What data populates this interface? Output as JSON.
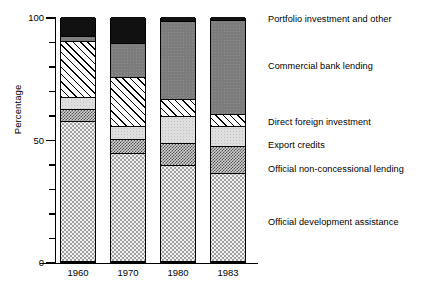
{
  "chart_data": {
    "type": "bar",
    "subtype": "stacked-percentage",
    "title": "",
    "xlabel": "",
    "ylabel": "Percentage",
    "categories": [
      "1960",
      "1970",
      "1980",
      "1983"
    ],
    "ylim": [
      0,
      100
    ],
    "yticks": [
      0,
      10,
      20,
      30,
      40,
      50,
      60,
      70,
      80,
      90,
      100
    ],
    "ytick_labels_shown": [
      "0",
      "50",
      "100"
    ],
    "grid": false,
    "legend_position": "right-aligned-to-segments",
    "stack_order_bottom_to_top": [
      "Official development assistance",
      "Official non-concessional lending",
      "Export credits",
      "Direct foreign investment",
      "Commercial bank lending",
      "Portfolio investment and other"
    ],
    "series": [
      {
        "name": "Official development assistance",
        "fill": "light-dotted",
        "color": "#f2f2f2",
        "values": [
          57,
          44,
          39,
          36
        ]
      },
      {
        "name": "Official non-concessional lending",
        "fill": "dark-checker",
        "color": "#8a8a8a",
        "values": [
          5,
          6,
          9,
          11
        ]
      },
      {
        "name": "Export credits",
        "fill": "light-grey",
        "color": "#dedede",
        "values": [
          5,
          5,
          11,
          8
        ]
      },
      {
        "name": "Direct foreign investment",
        "fill": "diagonal-hatch",
        "color": "#ffffff",
        "values": [
          23,
          20,
          7,
          5
        ]
      },
      {
        "name": "Commercial bank lending",
        "fill": "medium-grey",
        "color": "#7c7c7c",
        "values": [
          2,
          14,
          32,
          38.5
        ]
      },
      {
        "name": "Portfolio investment and other",
        "fill": "solid-black",
        "color": "#111111",
        "values": [
          8,
          11,
          2,
          1.5
        ]
      }
    ]
  },
  "axis": {
    "y_label": "Percentage",
    "y_tick_100": "100",
    "y_tick_50": "50",
    "y_tick_0": "0"
  },
  "xlabels": {
    "c0": "1960",
    "c1": "1970",
    "c2": "1980",
    "c3": "1983"
  },
  "legend": {
    "items": [
      {
        "label": "Portfolio investment and other",
        "top": 14
      },
      {
        "label": "Commercial bank lending",
        "top": 61
      },
      {
        "label": "Direct foreign investment",
        "top": 117
      },
      {
        "label": "Export credits",
        "top": 140
      },
      {
        "label": "Official non-concessional lending",
        "top": 164
      },
      {
        "label": "Official development assistance",
        "top": 217
      }
    ]
  }
}
